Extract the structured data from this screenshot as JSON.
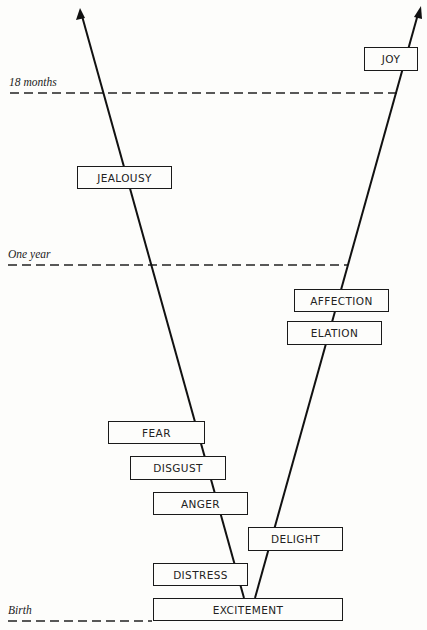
{
  "diagram": {
    "type": "emotional-development-branching",
    "time_markers": [
      {
        "label": "Birth",
        "y": 621
      },
      {
        "label": "One year",
        "y": 265
      },
      {
        "label": "18 months",
        "y": 93
      }
    ],
    "left_branch": [
      "DISTRESS",
      "ANGER",
      "DISGUST",
      "FEAR",
      "JEALOUSY"
    ],
    "right_branch": [
      "DELIGHT",
      "ELATION",
      "AFFECTION",
      "JOY"
    ],
    "root": "EXCITEMENT"
  },
  "labels": {
    "birth": "Birth",
    "one_year": "One year",
    "eighteen_months": "18 months"
  },
  "boxes": {
    "joy": "JOY",
    "jealousy": "JEALOUSY",
    "affection": "AFFECTION",
    "elation": "ELATION",
    "fear": "FEAR",
    "disgust": "DISGUST",
    "anger": "ANGER",
    "delight": "DELIGHT",
    "distress": "DISTRESS",
    "excitement": "EXCITEMENT"
  }
}
